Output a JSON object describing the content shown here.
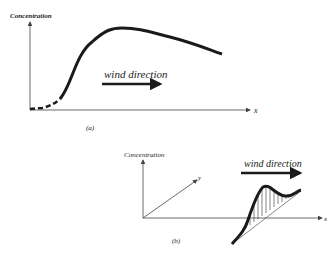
{
  "figure_a": {
    "ylabel": "Concentration",
    "xlabel": "x",
    "arrow_label": "wind direction",
    "caption": "(a)"
  },
  "figure_b": {
    "zlabel": "Concentration",
    "ylabel": "y",
    "xlabel": "x",
    "arrow_label": "wind direction",
    "caption": "(b)"
  },
  "colors": {
    "ink": "#1a1a1a",
    "axis": "#444444"
  }
}
